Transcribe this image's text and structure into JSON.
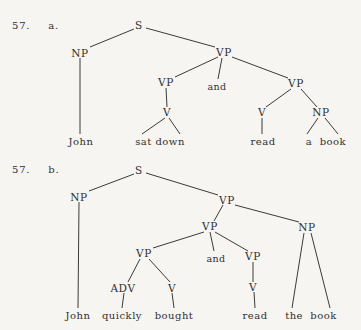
{
  "page": {
    "background_color": "#f6f5f2",
    "ink_color": "#3c3a38",
    "width": 361,
    "height": 330
  },
  "trees": [
    {
      "id": "tree-a",
      "item_number": "57.",
      "item_letter": "a.",
      "sentence": "John sat down and read a book",
      "nodes": [
        {
          "name": "s-root",
          "label": "S",
          "x": 139,
          "y": 26
        },
        {
          "name": "np-subject",
          "label": "NP",
          "x": 80,
          "y": 54
        },
        {
          "name": "vp-top",
          "label": "VP",
          "x": 224,
          "y": 53
        },
        {
          "name": "vp-left",
          "label": "VP",
          "x": 166,
          "y": 83
        },
        {
          "name": "conj-and",
          "label": "and",
          "x": 217,
          "y": 86
        },
        {
          "name": "vp-right",
          "label": "VP",
          "x": 296,
          "y": 84
        },
        {
          "name": "v-left",
          "label": "V",
          "x": 167,
          "y": 113
        },
        {
          "name": "v-right",
          "label": "V",
          "x": 262,
          "y": 113
        },
        {
          "name": "np-object",
          "label": "NP",
          "x": 321,
          "y": 113
        }
      ],
      "leaves": [
        {
          "name": "leaf-john",
          "label": "John",
          "x": 81,
          "y": 142
        },
        {
          "name": "leaf-sat-down",
          "label": "sat down",
          "x": 160,
          "y": 142
        },
        {
          "name": "leaf-read",
          "label": "read",
          "x": 263,
          "y": 142
        },
        {
          "name": "leaf-a-book",
          "label": "a  book",
          "x": 326,
          "y": 142
        }
      ]
    },
    {
      "id": "tree-b",
      "item_number": "57.",
      "item_letter": "b.",
      "sentence": "John quickly bought and read the book",
      "nodes": [
        {
          "name": "s-root",
          "label": "S",
          "x": 139,
          "y": 171
        },
        {
          "name": "np-subject",
          "label": "NP",
          "x": 79,
          "y": 198
        },
        {
          "name": "vp-top",
          "label": "VP",
          "x": 227,
          "y": 201
        },
        {
          "name": "vp-mid",
          "label": "VP",
          "x": 210,
          "y": 227
        },
        {
          "name": "np-object",
          "label": "NP",
          "x": 307,
          "y": 228
        },
        {
          "name": "vp-left",
          "label": "VP",
          "x": 144,
          "y": 254
        },
        {
          "name": "conj-and",
          "label": "and",
          "x": 216,
          "y": 258
        },
        {
          "name": "vp-right",
          "label": "VP",
          "x": 253,
          "y": 257
        },
        {
          "name": "adv",
          "label": "ADV",
          "x": 123,
          "y": 289
        },
        {
          "name": "v-bought",
          "label": "V",
          "x": 172,
          "y": 289
        },
        {
          "name": "v-read",
          "label": "V",
          "x": 253,
          "y": 288
        }
      ],
      "leaves": [
        {
          "name": "leaf-john",
          "label": "John",
          "x": 78,
          "y": 316
        },
        {
          "name": "leaf-quickly",
          "label": "quickly",
          "x": 122,
          "y": 316
        },
        {
          "name": "leaf-bought",
          "label": "bought",
          "x": 174,
          "y": 316
        },
        {
          "name": "leaf-read",
          "label": "read",
          "x": 255,
          "y": 316
        },
        {
          "name": "leaf-the-book",
          "label": "the  book",
          "x": 311,
          "y": 316
        }
      ]
    }
  ]
}
